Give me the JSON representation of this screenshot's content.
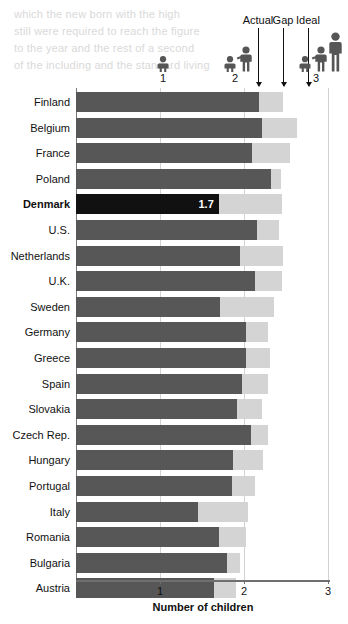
{
  "ghost": {
    "line1": "which  the   new  born  with  the  high",
    "line2": "still  were  required  to  reach  the  figure",
    "line3": "to  the  year  and  the  rest  of  a  second",
    "line4": "of  the  including  and  the  standard  living"
  },
  "header": {
    "actual_label": "Actual",
    "gap_label": "Gap",
    "ideal_label": "Ideal",
    "icon_groups": [
      {
        "name": "one-child-icon",
        "number": "1"
      },
      {
        "name": "two-children-icon",
        "number": "2"
      },
      {
        "name": "three-children-icon",
        "number": "3"
      }
    ]
  },
  "axis": {
    "x_title": "Number of children",
    "ticks": [
      "1",
      "2",
      "3"
    ],
    "tick_values": [
      1,
      2,
      3
    ]
  },
  "colors": {
    "actual": "#575757",
    "gap": "#d4d4d4",
    "highlight": "#111111",
    "axis": "#6f6f6f",
    "grid": "#d2d2d2"
  },
  "chart_data": {
    "type": "bar",
    "title": "",
    "subtitle": "",
    "orientation": "horizontal",
    "stacked": true,
    "xlabel": "Number of children",
    "ylabel": "",
    "xlim": [
      0,
      3
    ],
    "grid": true,
    "legend_position": "top",
    "legend": [
      "Actual",
      "Gap",
      "Ideal"
    ],
    "categories": [
      "Finland",
      "Belgium",
      "France",
      "Poland",
      "Denmark",
      "U.S.",
      "Netherlands",
      "U.K.",
      "Sweden",
      "Germany",
      "Greece",
      "Spain",
      "Slovakia",
      "Czech Rep.",
      "Hungary",
      "Portugal",
      "Italy",
      "Romania",
      "Bulgaria",
      "Austria"
    ],
    "series": [
      {
        "name": "Actual",
        "values": [
          2.18,
          2.21,
          2.1,
          2.32,
          1.7,
          2.15,
          1.95,
          2.13,
          1.72,
          2.02,
          2.02,
          1.98,
          1.92,
          2.08,
          1.87,
          1.86,
          1.45,
          1.7,
          1.8,
          1.64
        ]
      },
      {
        "name": "Ideal",
        "values": [
          2.46,
          2.63,
          2.55,
          2.44,
          2.45,
          2.42,
          2.46,
          2.45,
          2.36,
          2.28,
          2.31,
          2.28,
          2.21,
          2.28,
          2.23,
          2.13,
          2.05,
          2.02,
          1.95,
          1.9
        ]
      }
    ],
    "annotations": [
      {
        "category": "Denmark",
        "label": "1.7",
        "series": "Actual",
        "emphasis": true
      }
    ]
  },
  "rows": [
    {
      "label": "Finland",
      "actual": 2.18,
      "ideal": 2.46,
      "bold": false,
      "value_label": ""
    },
    {
      "label": "Belgium",
      "actual": 2.21,
      "ideal": 2.63,
      "bold": false,
      "value_label": ""
    },
    {
      "label": "France",
      "actual": 2.1,
      "ideal": 2.55,
      "bold": false,
      "value_label": ""
    },
    {
      "label": "Poland",
      "actual": 2.32,
      "ideal": 2.44,
      "bold": false,
      "value_label": ""
    },
    {
      "label": "Denmark",
      "actual": 1.7,
      "ideal": 2.45,
      "bold": true,
      "value_label": "1.7"
    },
    {
      "label": "U.S.",
      "actual": 2.15,
      "ideal": 2.42,
      "bold": false,
      "value_label": ""
    },
    {
      "label": "Netherlands",
      "actual": 1.95,
      "ideal": 2.46,
      "bold": false,
      "value_label": ""
    },
    {
      "label": "U.K.",
      "actual": 2.13,
      "ideal": 2.45,
      "bold": false,
      "value_label": ""
    },
    {
      "label": "Sweden",
      "actual": 1.72,
      "ideal": 2.36,
      "bold": false,
      "value_label": ""
    },
    {
      "label": "Germany",
      "actual": 2.02,
      "ideal": 2.28,
      "bold": false,
      "value_label": ""
    },
    {
      "label": "Greece",
      "actual": 2.02,
      "ideal": 2.31,
      "bold": false,
      "value_label": ""
    },
    {
      "label": "Spain",
      "actual": 1.98,
      "ideal": 2.28,
      "bold": false,
      "value_label": ""
    },
    {
      "label": "Slovakia",
      "actual": 1.92,
      "ideal": 2.21,
      "bold": false,
      "value_label": ""
    },
    {
      "label": "Czech Rep.",
      "actual": 2.08,
      "ideal": 2.28,
      "bold": false,
      "value_label": ""
    },
    {
      "label": "Hungary",
      "actual": 1.87,
      "ideal": 2.23,
      "bold": false,
      "value_label": ""
    },
    {
      "label": "Portugal",
      "actual": 1.86,
      "ideal": 2.13,
      "bold": false,
      "value_label": ""
    },
    {
      "label": "Italy",
      "actual": 1.45,
      "ideal": 2.05,
      "bold": false,
      "value_label": ""
    },
    {
      "label": "Romania",
      "actual": 1.7,
      "ideal": 2.02,
      "bold": false,
      "value_label": ""
    },
    {
      "label": "Bulgaria",
      "actual": 1.8,
      "ideal": 1.95,
      "bold": false,
      "value_label": ""
    },
    {
      "label": "Austria",
      "actual": 1.64,
      "ideal": 1.9,
      "bold": false,
      "value_label": ""
    }
  ]
}
